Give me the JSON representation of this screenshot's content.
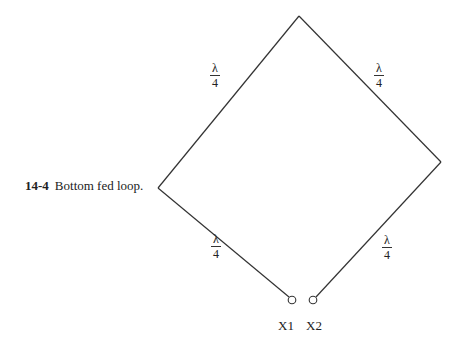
{
  "caption": {
    "number": "14-4",
    "text": "Bottom fed loop."
  },
  "diagram": {
    "type": "loop antenna",
    "line_color": "#333333",
    "vertices": {
      "top": [
        299,
        16
      ],
      "left": [
        158,
        188
      ],
      "right": [
        441,
        162
      ]
    },
    "segments": [
      {
        "name": "upper-left",
        "label_num": "λ",
        "label_den": "4"
      },
      {
        "name": "upper-right",
        "label_num": "λ",
        "label_den": "4"
      },
      {
        "name": "lower-left",
        "label_num": "λ",
        "label_den": "4"
      },
      {
        "name": "lower-right",
        "label_num": "λ",
        "label_den": "4"
      }
    ],
    "terminals": [
      {
        "label": "X1",
        "cx": 292,
        "cy": 300
      },
      {
        "label": "X2",
        "cx": 313,
        "cy": 300
      }
    ]
  }
}
